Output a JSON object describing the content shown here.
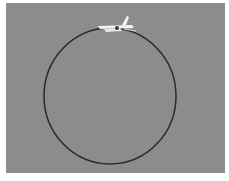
{
  "scene": {
    "description": "Photograph of an aircraft flying a circular path shown as a dark ring on a gray sky",
    "background_color": "#8c8c8c",
    "border_color": "#ffffff",
    "circle": {
      "stroke": "#2a2a2a",
      "stroke_width": 1.5
    },
    "aircraft": {
      "color": "#f2f2f2",
      "position": "top of circle"
    }
  }
}
